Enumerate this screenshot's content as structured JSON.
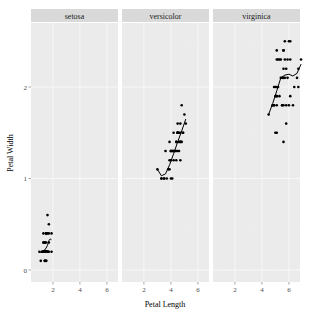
{
  "chart_data": {
    "type": "scatter",
    "title": "",
    "xlabel": "Petal Length",
    "ylabel": "Petal Width",
    "xlim": [
      0.6,
      7.3
    ],
    "ylim": [
      -0.05,
      2.6
    ],
    "x_ticks": [
      2,
      4,
      6
    ],
    "y_ticks": [
      0,
      1,
      2
    ],
    "grid": true,
    "legend": "none",
    "facets": [
      {
        "name": "setosa",
        "points": [
          [
            1.4,
            0.2
          ],
          [
            1.4,
            0.2
          ],
          [
            1.3,
            0.2
          ],
          [
            1.5,
            0.2
          ],
          [
            1.4,
            0.2
          ],
          [
            1.7,
            0.4
          ],
          [
            1.4,
            0.3
          ],
          [
            1.5,
            0.2
          ],
          [
            1.4,
            0.2
          ],
          [
            1.5,
            0.1
          ],
          [
            1.5,
            0.2
          ],
          [
            1.6,
            0.2
          ],
          [
            1.4,
            0.1
          ],
          [
            1.1,
            0.1
          ],
          [
            1.2,
            0.2
          ],
          [
            1.5,
            0.4
          ],
          [
            1.3,
            0.4
          ],
          [
            1.4,
            0.3
          ],
          [
            1.7,
            0.3
          ],
          [
            1.5,
            0.3
          ],
          [
            1.7,
            0.2
          ],
          [
            1.5,
            0.4
          ],
          [
            1.0,
            0.2
          ],
          [
            1.7,
            0.5
          ],
          [
            1.9,
            0.2
          ],
          [
            1.6,
            0.2
          ],
          [
            1.6,
            0.4
          ],
          [
            1.5,
            0.2
          ],
          [
            1.4,
            0.2
          ],
          [
            1.6,
            0.2
          ],
          [
            1.6,
            0.2
          ],
          [
            1.5,
            0.4
          ],
          [
            1.5,
            0.1
          ],
          [
            1.4,
            0.2
          ],
          [
            1.5,
            0.2
          ],
          [
            1.2,
            0.2
          ],
          [
            1.3,
            0.2
          ],
          [
            1.4,
            0.1
          ],
          [
            1.3,
            0.2
          ],
          [
            1.5,
            0.2
          ],
          [
            1.3,
            0.3
          ],
          [
            1.3,
            0.3
          ],
          [
            1.3,
            0.2
          ],
          [
            1.6,
            0.6
          ],
          [
            1.9,
            0.4
          ],
          [
            1.4,
            0.3
          ],
          [
            1.6,
            0.2
          ],
          [
            1.4,
            0.2
          ],
          [
            1.5,
            0.2
          ],
          [
            1.4,
            0.2
          ]
        ],
        "smooth": [
          [
            1.0,
            0.19
          ],
          [
            1.2,
            0.2
          ],
          [
            1.4,
            0.22
          ],
          [
            1.5,
            0.24
          ],
          [
            1.6,
            0.27
          ],
          [
            1.7,
            0.32
          ],
          [
            1.8,
            0.34
          ],
          [
            1.9,
            0.33
          ]
        ]
      },
      {
        "name": "versicolor",
        "points": [
          [
            4.7,
            1.4
          ],
          [
            4.5,
            1.5
          ],
          [
            4.9,
            1.5
          ],
          [
            4.0,
            1.3
          ],
          [
            4.6,
            1.5
          ],
          [
            4.5,
            1.3
          ],
          [
            4.7,
            1.6
          ],
          [
            3.3,
            1.0
          ],
          [
            4.6,
            1.3
          ],
          [
            3.9,
            1.4
          ],
          [
            3.5,
            1.0
          ],
          [
            4.2,
            1.5
          ],
          [
            4.0,
            1.0
          ],
          [
            4.7,
            1.4
          ],
          [
            3.6,
            1.3
          ],
          [
            4.4,
            1.4
          ],
          [
            4.5,
            1.5
          ],
          [
            4.1,
            1.0
          ],
          [
            4.5,
            1.5
          ],
          [
            3.9,
            1.1
          ],
          [
            4.8,
            1.8
          ],
          [
            4.0,
            1.3
          ],
          [
            4.9,
            1.5
          ],
          [
            4.7,
            1.2
          ],
          [
            4.3,
            1.3
          ],
          [
            4.4,
            1.4
          ],
          [
            4.8,
            1.4
          ],
          [
            5.0,
            1.7
          ],
          [
            4.5,
            1.5
          ],
          [
            3.5,
            1.0
          ],
          [
            3.8,
            1.1
          ],
          [
            3.7,
            1.0
          ],
          [
            3.9,
            1.2
          ],
          [
            5.1,
            1.6
          ],
          [
            4.5,
            1.5
          ],
          [
            4.5,
            1.6
          ],
          [
            4.7,
            1.5
          ],
          [
            4.4,
            1.3
          ],
          [
            4.1,
            1.3
          ],
          [
            4.0,
            1.3
          ],
          [
            4.4,
            1.2
          ],
          [
            4.6,
            1.4
          ],
          [
            4.0,
            1.2
          ],
          [
            3.3,
            1.0
          ],
          [
            4.2,
            1.3
          ],
          [
            4.2,
            1.2
          ],
          [
            4.2,
            1.3
          ],
          [
            4.3,
            1.3
          ],
          [
            3.0,
            1.1
          ],
          [
            4.1,
            1.3
          ]
        ],
        "smooth": [
          [
            3.0,
            1.1
          ],
          [
            3.3,
            1.03
          ],
          [
            3.6,
            1.05
          ],
          [
            3.9,
            1.15
          ],
          [
            4.2,
            1.27
          ],
          [
            4.5,
            1.4
          ],
          [
            4.8,
            1.52
          ],
          [
            5.1,
            1.65
          ]
        ]
      },
      {
        "name": "virginica",
        "points": [
          [
            6.0,
            2.5
          ],
          [
            5.1,
            1.9
          ],
          [
            5.9,
            2.1
          ],
          [
            5.6,
            1.8
          ],
          [
            5.8,
            2.2
          ],
          [
            6.6,
            2.1
          ],
          [
            4.5,
            1.7
          ],
          [
            6.3,
            1.8
          ],
          [
            5.8,
            1.8
          ],
          [
            6.1,
            2.5
          ],
          [
            5.1,
            2.0
          ],
          [
            5.3,
            1.9
          ],
          [
            5.5,
            2.1
          ],
          [
            5.0,
            2.0
          ],
          [
            5.1,
            2.4
          ],
          [
            5.3,
            2.3
          ],
          [
            5.5,
            1.8
          ],
          [
            6.7,
            2.2
          ],
          [
            6.9,
            2.3
          ],
          [
            5.0,
            1.5
          ],
          [
            5.7,
            2.3
          ],
          [
            4.9,
            2.0
          ],
          [
            6.7,
            2.0
          ],
          [
            4.9,
            1.8
          ],
          [
            5.7,
            2.1
          ],
          [
            6.0,
            1.8
          ],
          [
            4.8,
            1.8
          ],
          [
            4.9,
            1.8
          ],
          [
            5.6,
            2.1
          ],
          [
            5.8,
            1.6
          ],
          [
            6.1,
            1.9
          ],
          [
            6.4,
            2.0
          ],
          [
            5.6,
            2.2
          ],
          [
            5.1,
            1.5
          ],
          [
            5.6,
            1.4
          ],
          [
            6.1,
            2.3
          ],
          [
            5.6,
            2.4
          ],
          [
            5.5,
            1.8
          ],
          [
            4.8,
            1.8
          ],
          [
            5.4,
            2.1
          ],
          [
            5.6,
            2.4
          ],
          [
            5.1,
            2.3
          ],
          [
            5.1,
            1.9
          ],
          [
            5.9,
            2.3
          ],
          [
            5.7,
            2.5
          ],
          [
            5.2,
            2.3
          ],
          [
            5.0,
            1.9
          ],
          [
            5.2,
            2.0
          ],
          [
            5.4,
            2.3
          ],
          [
            5.1,
            1.8
          ]
        ],
        "smooth": [
          [
            4.5,
            1.7
          ],
          [
            4.8,
            1.82
          ],
          [
            5.1,
            1.96
          ],
          [
            5.4,
            2.1
          ],
          [
            5.7,
            2.13
          ],
          [
            6.0,
            2.14
          ],
          [
            6.3,
            2.12
          ],
          [
            6.6,
            2.15
          ],
          [
            6.9,
            2.25
          ]
        ]
      }
    ]
  }
}
